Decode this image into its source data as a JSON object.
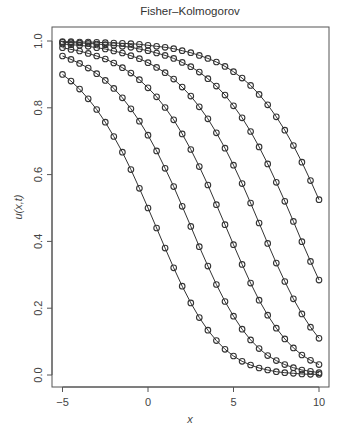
{
  "chart_data": {
    "type": "line",
    "title": "Fisher–Kolmogorov",
    "xlabel": "x",
    "ylabel": "u(x,t)",
    "xlim": [
      -5.6,
      10.6
    ],
    "ylim": [
      -0.036,
      1.04
    ],
    "x_ticks": [
      -5,
      0,
      5,
      10
    ],
    "x_tick_labels": [
      "−5",
      "0",
      "5",
      "10"
    ],
    "y_ticks": [
      0.0,
      0.2,
      0.4,
      0.6,
      0.8,
      1.0
    ],
    "y_tick_labels": [
      "0.0",
      "0.2",
      "0.4",
      "0.6",
      "0.8",
      "1.0"
    ],
    "grid": false,
    "legend": null,
    "marker": "open-circle",
    "line_color": "#333333",
    "x": [
      -5,
      -4.5,
      -4,
      -3.5,
      -3,
      -2.5,
      -2,
      -1.5,
      -1,
      -0.5,
      0,
      0.5,
      1,
      1.5,
      2,
      2.5,
      3,
      3.5,
      4,
      4.5,
      5,
      5.5,
      6,
      6.5,
      7,
      7.5,
      8,
      8.5,
      9,
      9.5,
      10
    ],
    "series": [
      {
        "name": "t=0",
        "values": [
          0.9,
          0.88,
          0.856,
          0.827,
          0.795,
          0.757,
          0.714,
          0.667,
          0.615,
          0.559,
          0.5,
          0.44,
          0.38,
          0.321,
          0.266,
          0.216,
          0.172,
          0.134,
          0.103,
          0.077,
          0.057,
          0.041,
          0.03,
          0.021,
          0.015,
          0.01,
          0.007,
          0.005,
          0.003,
          0.002,
          0.002
        ]
      },
      {
        "name": "t=1",
        "values": [
          0.955,
          0.945,
          0.933,
          0.919,
          0.902,
          0.882,
          0.858,
          0.83,
          0.797,
          0.76,
          0.718,
          0.671,
          0.619,
          0.564,
          0.505,
          0.445,
          0.384,
          0.326,
          0.271,
          0.22,
          0.176,
          0.137,
          0.105,
          0.079,
          0.058,
          0.043,
          0.031,
          0.022,
          0.015,
          0.011,
          0.007
        ]
      },
      {
        "name": "t=2",
        "values": [
          0.98,
          0.975,
          0.97,
          0.963,
          0.955,
          0.946,
          0.934,
          0.92,
          0.904,
          0.884,
          0.86,
          0.833,
          0.801,
          0.764,
          0.722,
          0.675,
          0.624,
          0.569,
          0.51,
          0.45,
          0.39,
          0.331,
          0.275,
          0.224,
          0.179,
          0.14,
          0.108,
          0.081,
          0.06,
          0.044,
          0.031
        ]
      },
      {
        "name": "t=3",
        "values": [
          0.991,
          0.989,
          0.987,
          0.984,
          0.98,
          0.976,
          0.97,
          0.964,
          0.956,
          0.947,
          0.935,
          0.921,
          0.905,
          0.886,
          0.862,
          0.835,
          0.803,
          0.767,
          0.725,
          0.679,
          0.628,
          0.573,
          0.515,
          0.455,
          0.394,
          0.335,
          0.28,
          0.228,
          0.183,
          0.143,
          0.11
        ]
      },
      {
        "name": "t=4",
        "values": [
          0.996,
          0.995,
          0.994,
          0.993,
          0.991,
          0.989,
          0.987,
          0.984,
          0.981,
          0.976,
          0.971,
          0.964,
          0.957,
          0.948,
          0.936,
          0.923,
          0.907,
          0.887,
          0.865,
          0.838,
          0.806,
          0.77,
          0.729,
          0.683,
          0.632,
          0.577,
          0.52,
          0.46,
          0.399,
          0.34,
          0.284
        ]
      },
      {
        "name": "t=5",
        "values": [
          0.998,
          0.998,
          0.997,
          0.997,
          0.996,
          0.995,
          0.994,
          0.993,
          0.992,
          0.99,
          0.987,
          0.984,
          0.981,
          0.977,
          0.971,
          0.965,
          0.957,
          0.948,
          0.937,
          0.924,
          0.908,
          0.889,
          0.867,
          0.84,
          0.809,
          0.773,
          0.733,
          0.687,
          0.637,
          0.582,
          0.525
        ]
      }
    ]
  },
  "layout": {
    "plot_left": 52,
    "plot_top": 27,
    "plot_right": 329,
    "plot_bottom": 387,
    "x0_px": 62.5,
    "px_per_x": 17.1,
    "y0_px": 375,
    "px_per_y": 334
  }
}
